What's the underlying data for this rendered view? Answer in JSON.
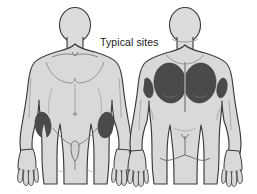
{
  "diagram": {
    "title": "Typical sites",
    "type": "anatomical-body-map",
    "background_color": "#ffffff",
    "caption": {
      "text": "Typical sites",
      "color": "#1b1b1b",
      "x": 100,
      "y": 36
    },
    "palette": {
      "body_fill": "#d9d9d9",
      "body_fill_light": "#e3e3e3",
      "outline": "#3a3a3a",
      "detail_line": "#8e8e8e",
      "site_patch_fill": "#4a4a4a",
      "site_patch_fill_dark": "#3f3f3f",
      "text": "#1b1b1b"
    },
    "figures": [
      {
        "id": "anterior-figure",
        "label": "Anterior view",
        "view": "front",
        "position": "left",
        "site_patches": [
          {
            "id": "site-anterior-thigh-left",
            "label": "Outer left thigh",
            "shape": "oval",
            "cx": 43,
            "cy": 125,
            "rx": 8,
            "ry": 13,
            "rotation": -8
          },
          {
            "id": "site-anterior-thigh-right",
            "label": "Outer right thigh",
            "shape": "oval",
            "cx": 106,
            "cy": 125,
            "rx": 8,
            "ry": 13,
            "rotation": 8
          }
        ]
      },
      {
        "id": "posterior-figure",
        "label": "Posterior view",
        "view": "back",
        "position": "right",
        "site_patches": [
          {
            "id": "site-posterior-upper-back-left",
            "label": "Left scapular / upper back",
            "shape": "oval",
            "cx": 170,
            "cy": 83,
            "rx": 16,
            "ry": 20,
            "rotation": -6
          },
          {
            "id": "site-posterior-upper-back-right",
            "label": "Right scapular / upper back",
            "shape": "oval",
            "cx": 200,
            "cy": 83,
            "rx": 16,
            "ry": 20,
            "rotation": 6
          },
          {
            "id": "site-posterior-arm-left",
            "label": "Left outer upper arm",
            "shape": "oval",
            "cx": 148,
            "cy": 88,
            "rx": 5,
            "ry": 10,
            "rotation": -10
          },
          {
            "id": "site-posterior-arm-right",
            "label": "Right outer upper arm",
            "shape": "oval",
            "cx": 222,
            "cy": 88,
            "rx": 5,
            "ry": 10,
            "rotation": 10
          }
        ]
      }
    ]
  }
}
